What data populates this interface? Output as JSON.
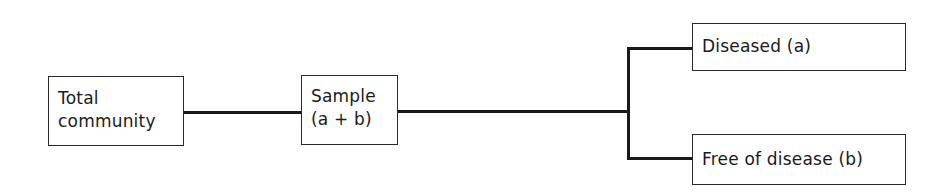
{
  "diagram": {
    "type": "flowchart",
    "nodes": {
      "total_community": {
        "line1": "Total",
        "line2": "community"
      },
      "sample": {
        "line1": "Sample",
        "line2": "(a + b)"
      },
      "diseased": {
        "label": "Diseased (a)"
      },
      "free": {
        "label": "Free of disease (b)"
      }
    },
    "edges": [
      {
        "from": "total_community",
        "to": "sample"
      },
      {
        "from": "sample",
        "to": "diseased"
      },
      {
        "from": "sample",
        "to": "free"
      }
    ],
    "colors": {
      "line": "#1a1a1a",
      "border": "#2a2a2a",
      "background": "#ffffff"
    }
  }
}
